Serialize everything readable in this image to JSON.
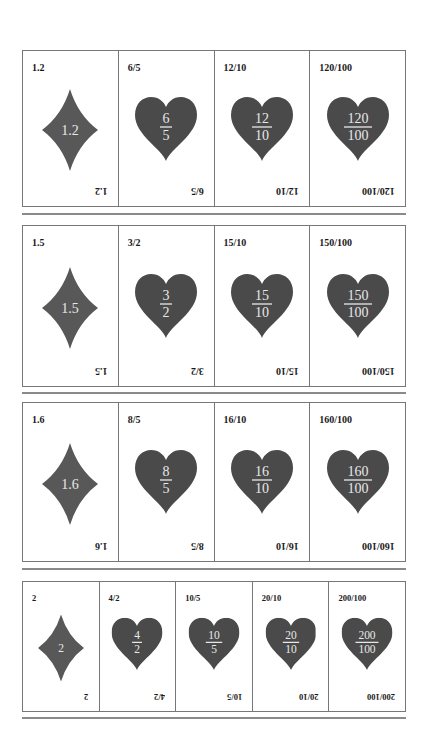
{
  "colors": {
    "heart": "#4a4a4a",
    "diamond": "#585858",
    "suit_text": "#e8e8e8"
  },
  "rows": [
    {
      "cards": [
        {
          "suit": "diamond",
          "label": "1.2",
          "value": "1.2"
        },
        {
          "suit": "heart",
          "label": "6/5",
          "numerator": "6",
          "denominator": "5"
        },
        {
          "suit": "heart",
          "label": "12/10",
          "numerator": "12",
          "denominator": "10"
        },
        {
          "suit": "heart",
          "label": "120/100",
          "numerator": "120",
          "denominator": "100"
        }
      ]
    },
    {
      "cards": [
        {
          "suit": "diamond",
          "label": "1.5",
          "value": "1.5"
        },
        {
          "suit": "heart",
          "label": "3/2",
          "numerator": "3",
          "denominator": "2"
        },
        {
          "suit": "heart",
          "label": "15/10",
          "numerator": "15",
          "denominator": "10"
        },
        {
          "suit": "heart",
          "label": "150/100",
          "numerator": "150",
          "denominator": "100"
        }
      ]
    },
    {
      "cards": [
        {
          "suit": "diamond",
          "label": "1.6",
          "value": "1.6"
        },
        {
          "suit": "heart",
          "label": "8/5",
          "numerator": "8",
          "denominator": "5"
        },
        {
          "suit": "heart",
          "label": "16/10",
          "numerator": "16",
          "denominator": "10"
        },
        {
          "suit": "heart",
          "label": "160/100",
          "numerator": "160",
          "denominator": "100"
        }
      ]
    },
    {
      "cards": [
        {
          "suit": "diamond",
          "label": "2",
          "value": "2"
        },
        {
          "suit": "heart",
          "label": "4/2",
          "numerator": "4",
          "denominator": "2"
        },
        {
          "suit": "heart",
          "label": "10/5",
          "numerator": "10",
          "denominator": "5"
        },
        {
          "suit": "heart",
          "label": "20/10",
          "numerator": "20",
          "denominator": "10"
        },
        {
          "suit": "heart",
          "label": "200/100",
          "numerator": "200",
          "denominator": "100"
        }
      ]
    }
  ]
}
